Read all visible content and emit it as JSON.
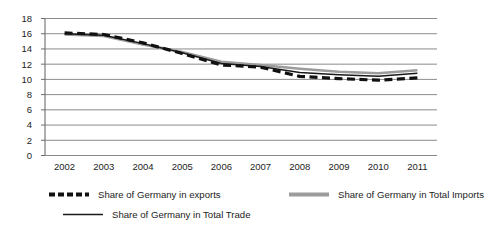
{
  "chart_data": {
    "type": "line",
    "title": "",
    "xlabel": "",
    "ylabel": "",
    "x": [
      2002,
      2003,
      2004,
      2005,
      2006,
      2007,
      2008,
      2009,
      2010,
      2011
    ],
    "categories": [
      "2002",
      "2003",
      "2004",
      "2005",
      "2006",
      "2007",
      "2008",
      "2009",
      "2010",
      "2011"
    ],
    "ylim": [
      0,
      18
    ],
    "ytick_step": 2,
    "yticks": [
      "0",
      "2",
      "4",
      "6",
      "8",
      "10",
      "12",
      "14",
      "16",
      "18"
    ],
    "grid": "horizontal",
    "legend_position": "bottom",
    "series": [
      {
        "name": "Share of Germany in exports",
        "key": "exports",
        "style": "dashed",
        "color": "#111111",
        "width": 3.2,
        "values": [
          16.1,
          15.9,
          14.8,
          13.4,
          11.9,
          11.6,
          10.4,
          10.1,
          9.9,
          10.2
        ]
      },
      {
        "name": "Share of Germany in Total Imports",
        "key": "imports",
        "style": "solid",
        "color": "#9c9c9c",
        "width": 2.6,
        "values": [
          15.9,
          15.7,
          14.6,
          13.6,
          12.3,
          11.9,
          11.4,
          11.0,
          10.8,
          11.2
        ]
      },
      {
        "name": "Share of Germany in Total Trade",
        "key": "trade",
        "style": "solid",
        "color": "#1a1a1a",
        "width": 1.5,
        "values": [
          16.0,
          15.8,
          14.7,
          13.5,
          12.1,
          11.7,
          10.9,
          10.6,
          10.4,
          10.8
        ]
      }
    ]
  },
  "axes": {
    "y_label_x": 32,
    "x_label_y": 170
  },
  "legend": {
    "items": [
      {
        "label": "Share of Germany in exports"
      },
      {
        "label": "Share of Germany in Total Imports"
      },
      {
        "label": "Share of Germany in Total Trade"
      }
    ]
  }
}
